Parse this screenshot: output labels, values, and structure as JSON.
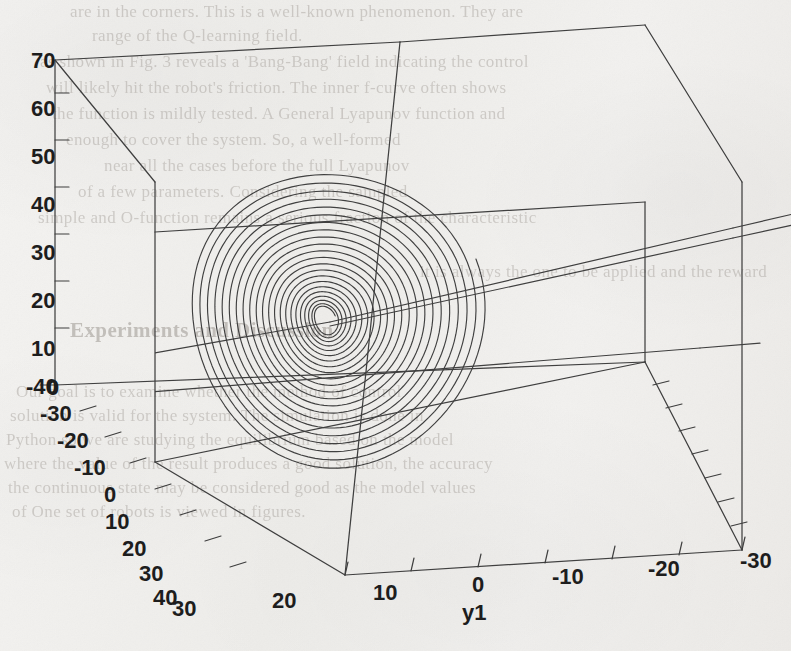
{
  "figure": {
    "kind": "gnuplot-3d-phase-portrait",
    "background_color": "#f1f0ee",
    "ink_color": "#3a3a3a",
    "label_color": "#1d1d1d"
  },
  "axes": {
    "z_axis": {
      "name": "z-axis",
      "label": "",
      "ticks": [
        "70",
        "60",
        "50",
        "40",
        "30",
        "20",
        "10",
        "0"
      ],
      "values": [
        70,
        60,
        50,
        40,
        30,
        20,
        10,
        0
      ],
      "range": [
        0,
        70
      ]
    },
    "x_axis": {
      "name": "x-axis",
      "label": "",
      "ticks": [
        "-40",
        "-30",
        "-20",
        "-10",
        "0",
        "10",
        "20",
        "30",
        "40"
      ],
      "values": [
        -40,
        -30,
        -20,
        -10,
        0,
        10,
        20,
        30,
        40
      ],
      "range": [
        -40,
        40
      ]
    },
    "y_axis": {
      "name": "y1",
      "label": "y1",
      "ticks": [
        "30",
        "20",
        "10",
        "0",
        "-10",
        "-20",
        "-30"
      ],
      "values": [
        30,
        20,
        10,
        0,
        -10,
        -20,
        -30
      ],
      "range": [
        -30,
        30
      ]
    }
  },
  "chart_data": {
    "type": "line",
    "title": "",
    "subtitle": "",
    "xlabel": "",
    "ylabel": "y1",
    "zlabel": "",
    "projection": "3d-perspective-box",
    "grid": true,
    "legend": null,
    "legend_position": "none",
    "xlim": [
      -40,
      40
    ],
    "ylim": [
      -30,
      30
    ],
    "zlim": [
      0,
      70
    ],
    "xticks": [
      -40,
      -30,
      -20,
      -10,
      0,
      10,
      20,
      30,
      40
    ],
    "yticks": [
      30,
      20,
      10,
      0,
      -10,
      -20,
      -30
    ],
    "zticks": [
      0,
      10,
      20,
      30,
      40,
      50,
      60,
      70
    ],
    "series": [
      {
        "name": "spiral-trajectory",
        "description": "inward spiral converging to a small closed orbit near the origin",
        "turns": 22,
        "center_xy": [
          325,
          320
        ],
        "outer_radius_px": [
          148,
          152
        ],
        "inner_radius_px": [
          10,
          14
        ],
        "tilt_deg": -22
      },
      {
        "name": "incoming-trajectory-1",
        "description": "near-straight trajectory entering plot from the left edge toward the spiral center",
        "points_px": [
          [
            137,
            356
          ],
          [
            330,
            322
          ]
        ]
      },
      {
        "name": "outgoing-trajectory-2",
        "description": "near-straight trajectory leaving spiral center toward the right edge",
        "points_px": [
          [
            330,
            322
          ],
          [
            733,
            228
          ]
        ]
      },
      {
        "name": "outgoing-trajectory-3",
        "description": "second near-straight trajectory slightly below the first, toward the right edge",
        "points_px": [
          [
            330,
            326
          ],
          [
            733,
            238
          ]
        ]
      },
      {
        "name": "lower-trajectory-4",
        "description": "trajectory crossing the lower part of the box toward the right",
        "points_px": [
          [
            150,
            392
          ],
          [
            700,
            348
          ]
        ]
      }
    ]
  },
  "tick_labels": {
    "z": [
      {
        "text": "70",
        "x": 31,
        "y": 48
      },
      {
        "text": "60",
        "x": 31,
        "y": 96
      },
      {
        "text": "50",
        "x": 31,
        "y": 144
      },
      {
        "text": "40",
        "x": 31,
        "y": 192
      },
      {
        "text": "30",
        "x": 31,
        "y": 240
      },
      {
        "text": "20",
        "x": 31,
        "y": 288
      },
      {
        "text": "10",
        "x": 31,
        "y": 336
      },
      {
        "text": "0",
        "x": 47,
        "y": 375
      }
    ],
    "x": [
      {
        "text": "-40",
        "x": 26,
        "y": 374
      },
      {
        "text": "-30",
        "x": 40,
        "y": 401
      },
      {
        "text": "-20",
        "x": 57,
        "y": 428
      },
      {
        "text": "-10",
        "x": 74,
        "y": 455
      },
      {
        "text": "0",
        "x": 104,
        "y": 482
      },
      {
        "text": "10",
        "x": 105,
        "y": 509
      },
      {
        "text": "20",
        "x": 122,
        "y": 536
      },
      {
        "text": "30",
        "x": 139,
        "y": 561
      },
      {
        "text": "40",
        "x": 153,
        "y": 585
      }
    ],
    "y": [
      {
        "text": "30",
        "x": 172,
        "y": 596
      },
      {
        "text": "20",
        "x": 272,
        "y": 588
      },
      {
        "text": "10",
        "x": 373,
        "y": 580
      },
      {
        "text": "0",
        "x": 472,
        "y": 572
      },
      {
        "text": "-10",
        "x": 552,
        "y": 564
      },
      {
        "text": "-20",
        "x": 648,
        "y": 556
      },
      {
        "text": "-30",
        "x": 740,
        "y": 548
      }
    ],
    "axis_title_y": {
      "text": "y1",
      "x": 462,
      "y": 600
    }
  },
  "showthrough_text": [
    {
      "text": "are in the corners. This is a well-known phenomenon. They are",
      "x": 70,
      "y": 2,
      "size": 17
    },
    {
      "text": "range of the Q-learning field.",
      "x": 92,
      "y": 26,
      "size": 17
    },
    {
      "text": "as shown in Fig. 3 reveals a 'Bang-Bang' field indicating the control",
      "x": 40,
      "y": 52,
      "size": 17
    },
    {
      "text": "will likely hit the robot's friction. The inner f-curve often shows",
      "x": 46,
      "y": 78,
      "size": 17
    },
    {
      "text": "the function is mildly tested. A General Lyapunov function and",
      "x": 52,
      "y": 104,
      "size": 17
    },
    {
      "text": "enough to cover the system. So, a well-formed",
      "x": 66,
      "y": 130,
      "size": 17
    },
    {
      "text": "near all the cases before the full Lyapunov",
      "x": 104,
      "y": 156,
      "size": 17
    },
    {
      "text": "of a few parameters. Considering the sampled",
      "x": 78,
      "y": 182,
      "size": 17
    },
    {
      "text": "simple and O-function remains a serious fraction of the characteristic",
      "x": 38,
      "y": 208,
      "size": 17
    },
    {
      "text": "it is always the one to be applied and the reward",
      "x": 420,
      "y": 262,
      "size": 17
    },
    {
      "text": "Experiments and Discussion",
      "x": 70,
      "y": 318,
      "size": 21,
      "head": true
    },
    {
      "text": "Our goal is to examine whether the method of control",
      "x": 16,
      "y": 382,
      "size": 17
    },
    {
      "text": "solution is valid for the system. The simulation is done in",
      "x": 10,
      "y": 406,
      "size": 17
    },
    {
      "text": "Python so we are studying the equilibrium based on the model",
      "x": 6,
      "y": 430,
      "size": 17
    },
    {
      "text": "where the value of the result produces a good solution, the accuracy",
      "x": 4,
      "y": 454,
      "size": 17
    },
    {
      "text": "the continuous state may be considered good as the model values",
      "x": 8,
      "y": 478,
      "size": 17
    },
    {
      "text": "of One set of robots is viewed in figures.",
      "x": 12,
      "y": 502,
      "size": 17
    }
  ]
}
